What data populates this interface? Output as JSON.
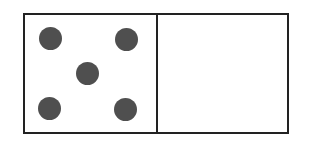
{
  "domino": {
    "left_half": {
      "value": 5,
      "pips": [
        {
          "name": "pip-top-left",
          "cx": 50,
          "cy": 38
        },
        {
          "name": "pip-top-right",
          "cx": 126,
          "cy": 39
        },
        {
          "name": "pip-center",
          "cx": 87,
          "cy": 73
        },
        {
          "name": "pip-bottom-left",
          "cx": 49,
          "cy": 108
        },
        {
          "name": "pip-bottom-right",
          "cx": 125,
          "cy": 109
        }
      ]
    },
    "right_half": {
      "value": 0,
      "pips": []
    },
    "colors": {
      "border": "#222222",
      "pip": "#4f4f4f",
      "face": "#ffffff"
    }
  }
}
